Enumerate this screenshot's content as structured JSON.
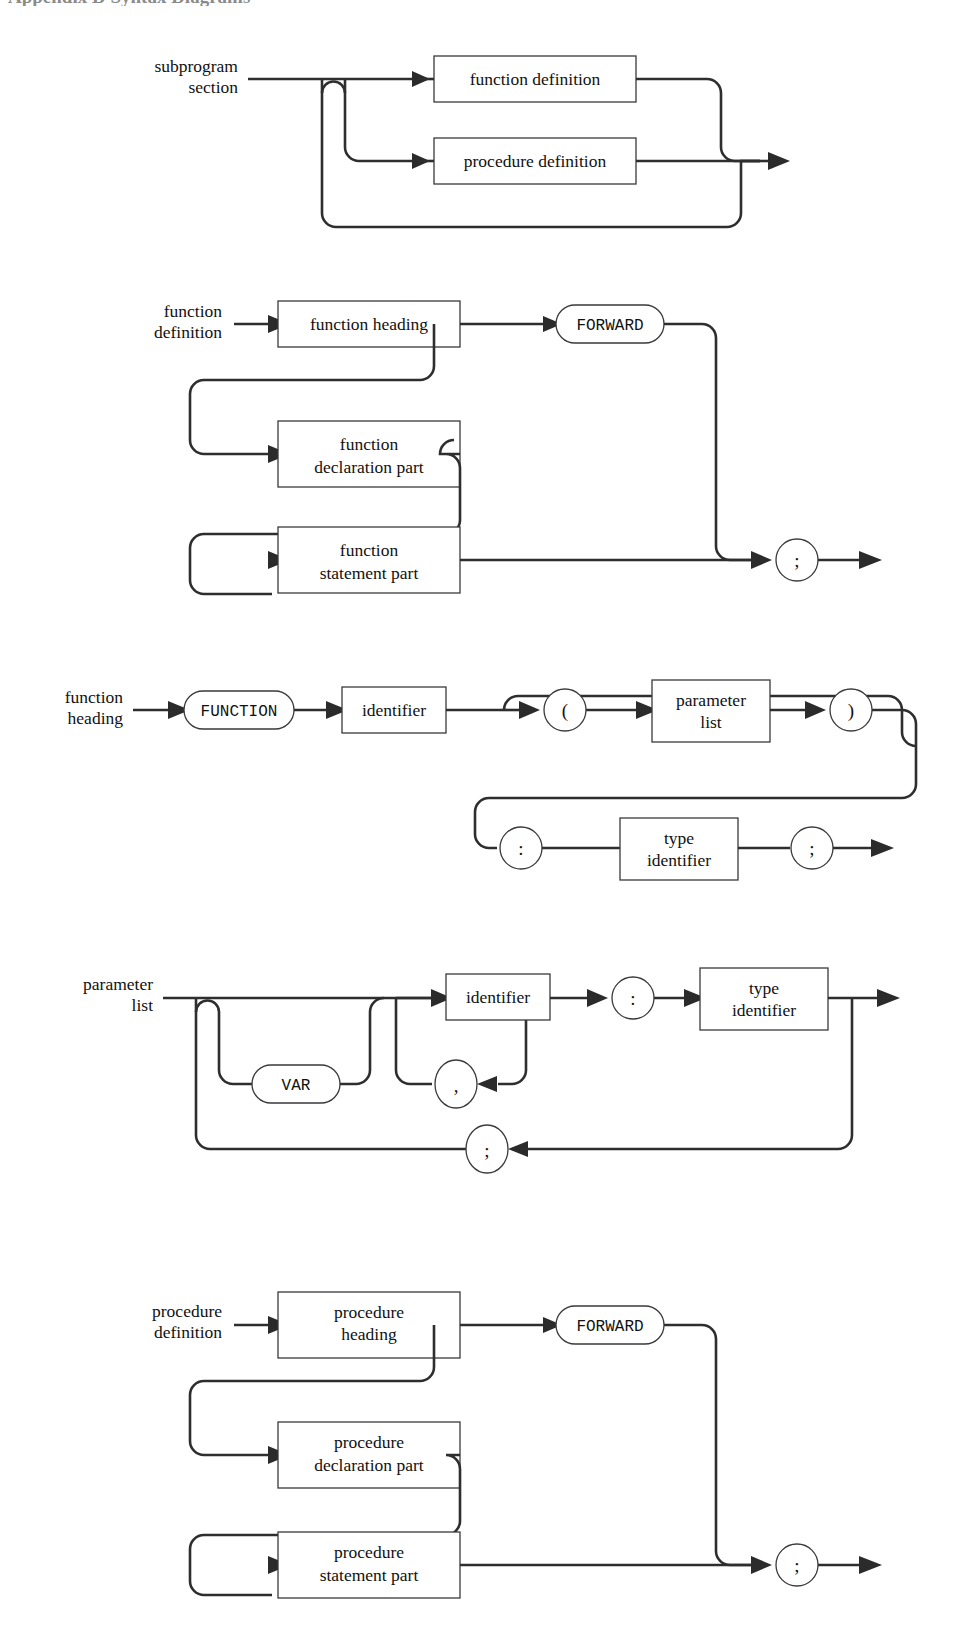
{
  "page": {
    "heading": "Appendix D  Syntax Diagrams",
    "background": "#ffffff",
    "ink": "#2e2e2e",
    "width": 972,
    "height": 1651
  },
  "diagrams": [
    {
      "id": "subprogram-section",
      "label_line1": "subprogram",
      "label_line2": "section",
      "nodes": [
        {
          "kind": "nonterminal",
          "text": "function definition"
        },
        {
          "kind": "nonterminal",
          "text": "procedure definition"
        }
      ],
      "structure": "choice of function definition or procedure definition, with bypass loop (repetition)"
    },
    {
      "id": "function-definition",
      "label_line1": "function",
      "label_line2": "definition",
      "nodes": [
        {
          "kind": "nonterminal",
          "text": "function heading"
        },
        {
          "kind": "terminal",
          "text": "FORWARD"
        },
        {
          "kind": "nonterminal",
          "text_line1": "function",
          "text_line2": "declaration part"
        },
        {
          "kind": "nonterminal",
          "text_line1": "function",
          "text_line2": "statement part"
        },
        {
          "kind": "terminal-symbol",
          "text": ";"
        }
      ]
    },
    {
      "id": "function-heading",
      "label_line1": "function",
      "label_line2": "heading",
      "nodes": [
        {
          "kind": "terminal",
          "text": "FUNCTION"
        },
        {
          "kind": "nonterminal",
          "text": "identifier"
        },
        {
          "kind": "terminal-symbol",
          "text": "("
        },
        {
          "kind": "nonterminal",
          "text_line1": "parameter",
          "text_line2": "list"
        },
        {
          "kind": "terminal-symbol",
          "text": ")"
        },
        {
          "kind": "terminal-symbol",
          "text": ":"
        },
        {
          "kind": "nonterminal",
          "text_line1": "type",
          "text_line2": "identifier"
        },
        {
          "kind": "terminal-symbol",
          "text": ";"
        }
      ]
    },
    {
      "id": "parameter-list",
      "label_line1": "parameter",
      "label_line2": "list",
      "nodes": [
        {
          "kind": "terminal",
          "text": "VAR"
        },
        {
          "kind": "nonterminal",
          "text": "identifier"
        },
        {
          "kind": "terminal-symbol",
          "text": ","
        },
        {
          "kind": "terminal-symbol",
          "text": ":"
        },
        {
          "kind": "nonterminal",
          "text_line1": "type",
          "text_line2": "identifier"
        },
        {
          "kind": "terminal-symbol",
          "text": ";"
        }
      ]
    },
    {
      "id": "procedure-definition",
      "label_line1": "procedure",
      "label_line2": "definition",
      "nodes": [
        {
          "kind": "nonterminal",
          "text_line1": "procedure",
          "text_line2": "heading"
        },
        {
          "kind": "terminal",
          "text": "FORWARD"
        },
        {
          "kind": "nonterminal",
          "text_line1": "procedure",
          "text_line2": "declaration part"
        },
        {
          "kind": "nonterminal",
          "text_line1": "procedure",
          "text_line2": "statement part"
        },
        {
          "kind": "terminal-symbol",
          "text": ";"
        }
      ]
    }
  ],
  "labels": {
    "subprogram_section_1": "subprogram",
    "subprogram_section_2": "section",
    "function_definition_1": "function",
    "function_definition_2": "definition",
    "function_heading_1": "function",
    "function_heading_2": "heading",
    "parameter_list_1": "parameter",
    "parameter_list_2": "list",
    "procedure_definition_1": "procedure",
    "procedure_definition_2": "definition"
  },
  "text": {
    "function_definition": "function definition",
    "procedure_definition": "procedure definition",
    "function_heading": "function heading",
    "forward": "FORWARD",
    "function": "function",
    "declaration_part": "declaration part",
    "statement_part": "statement part",
    "semicolon": ";",
    "colon": ":",
    "comma": ",",
    "paren_open": "(",
    "paren_close": ")",
    "kw_function": "FUNCTION",
    "kw_var": "VAR",
    "identifier": "identifier",
    "parameter": "parameter",
    "list": "list",
    "type": "type",
    "procedure": "procedure",
    "heading": "heading"
  }
}
